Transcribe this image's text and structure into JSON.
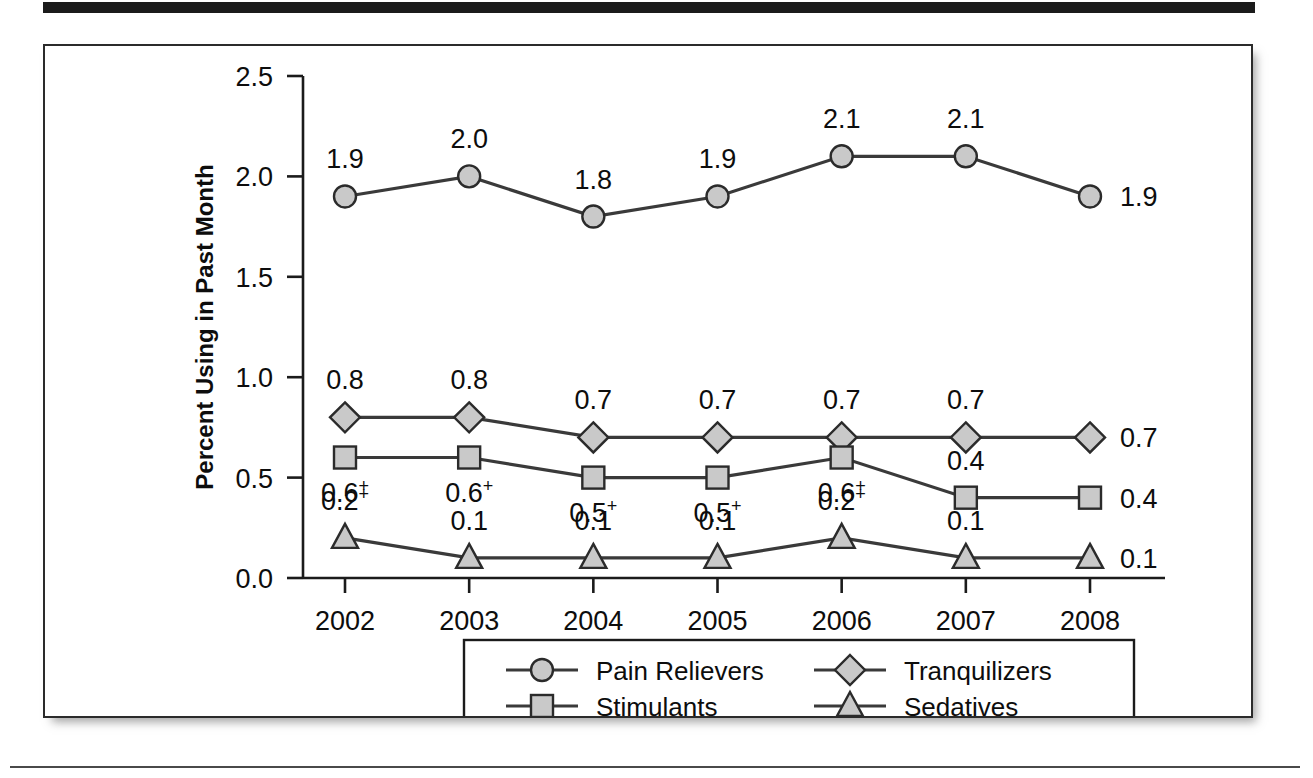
{
  "figure": {
    "background_color": "#ffffff",
    "frame_color": "#2b2b2b",
    "top_bar_color": "#1b1b1b",
    "marker_fill": "#c9c9c9",
    "line_color": "#3a3a3a"
  },
  "chart_data": {
    "type": "line",
    "title": "",
    "xlabel": "",
    "ylabel": "Percent Using in Past Month",
    "categories": [
      "2002",
      "2003",
      "2004",
      "2005",
      "2006",
      "2007",
      "2008"
    ],
    "x": [
      2002,
      2003,
      2004,
      2005,
      2006,
      2007,
      2008
    ],
    "ylim": [
      0.0,
      2.5
    ],
    "yticks": [
      "0.0",
      "0.5",
      "1.0",
      "1.5",
      "2.0",
      "2.5"
    ],
    "ytick_values": [
      0.0,
      0.5,
      1.0,
      1.5,
      2.0,
      2.5
    ],
    "grid": false,
    "legend_position": "bottom-center",
    "series": [
      {
        "name": "Pain Relievers",
        "marker": "circle",
        "values": [
          1.9,
          2.0,
          1.8,
          1.9,
          2.1,
          2.1,
          1.9
        ],
        "labels": [
          "1.9",
          "2.0",
          "1.8",
          "1.9",
          "2.1",
          "2.1",
          "1.9"
        ],
        "label_flags": [
          "",
          "",
          "",
          "",
          "",
          "",
          ""
        ],
        "label_positions": [
          "above",
          "above",
          "above",
          "above",
          "above",
          "above",
          "right"
        ]
      },
      {
        "name": "Tranquilizers",
        "marker": "diamond",
        "values": [
          0.8,
          0.8,
          0.7,
          0.7,
          0.7,
          0.7,
          0.7
        ],
        "labels": [
          "0.8",
          "0.8",
          "0.7",
          "0.7",
          "0.7",
          "0.7",
          "0.7"
        ],
        "label_flags": [
          "",
          "",
          "",
          "",
          "",
          "",
          ""
        ],
        "label_positions": [
          "above",
          "above",
          "above",
          "above",
          "above",
          "above",
          "right"
        ]
      },
      {
        "name": "Stimulants",
        "marker": "square",
        "values": [
          0.6,
          0.6,
          0.5,
          0.5,
          0.6,
          0.4,
          0.4
        ],
        "labels": [
          "0.6",
          "0.6",
          "0.5",
          "0.5",
          "0.6",
          "0.4",
          "0.4"
        ],
        "label_flags": [
          "+",
          "+",
          "+",
          "+",
          "+",
          "",
          ""
        ],
        "label_positions": [
          "below",
          "below",
          "below",
          "below",
          "below",
          "above",
          "right"
        ]
      },
      {
        "name": "Sedatives",
        "marker": "triangle",
        "values": [
          0.2,
          0.1,
          0.1,
          0.1,
          0.2,
          0.1,
          0.1
        ],
        "labels": [
          "0.2",
          "0.1",
          "0.1",
          "0.1",
          "0.2",
          "0.1",
          "0.1"
        ],
        "label_flags": [
          "+",
          "",
          "",
          "",
          "+",
          "",
          ""
        ],
        "label_positions": [
          "above",
          "above",
          "above",
          "above",
          "above",
          "above",
          "right"
        ]
      }
    ],
    "legend": [
      {
        "label": "Pain Relievers",
        "marker": "circle"
      },
      {
        "label": "Tranquilizers",
        "marker": "diamond"
      },
      {
        "label": "Stimulants",
        "marker": "square"
      },
      {
        "label": "Sedatives",
        "marker": "triangle"
      }
    ]
  }
}
